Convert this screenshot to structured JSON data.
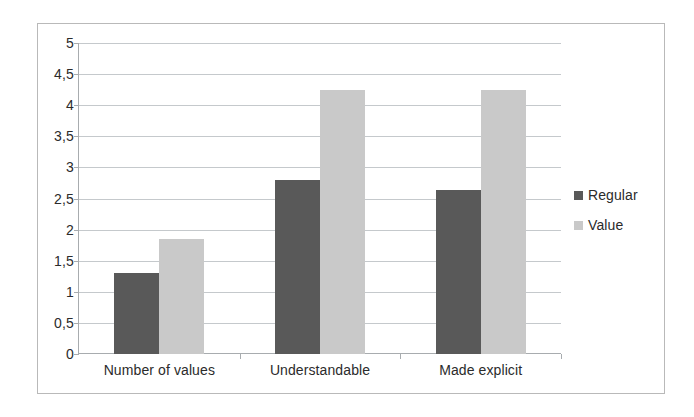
{
  "chart_data": {
    "type": "bar",
    "title": "",
    "xlabel": "",
    "ylabel": "",
    "ylim": [
      0,
      5
    ],
    "ytick_step": 0.5,
    "ytick_labels": [
      "0",
      "0,5",
      "1",
      "1,5",
      "2",
      "2,5",
      "3",
      "3,5",
      "4",
      "4,5",
      "5"
    ],
    "ytick_values": [
      0,
      0.5,
      1,
      1.5,
      2,
      2.5,
      3,
      3.5,
      4,
      4.5,
      5
    ],
    "grid": true,
    "legend_position": "right",
    "categories": [
      "Number of values",
      "Understandable",
      "Made explicit"
    ],
    "series": [
      {
        "name": "Regular",
        "color": "#595959",
        "values": [
          1.3,
          2.8,
          2.63
        ]
      },
      {
        "name": "Value",
        "color": "#c9c9c9",
        "values": [
          1.85,
          4.25,
          4.25
        ]
      }
    ]
  },
  "legend": {
    "items": [
      {
        "label": "Regular",
        "swatch": "legend-swatch-regular"
      },
      {
        "label": "Value",
        "swatch": "legend-swatch-value"
      }
    ]
  },
  "colors": {
    "series_regular": "#595959",
    "series_value": "#c9c9c9",
    "gridline": "#c5c9cc",
    "axis": "#a8acaf",
    "frame_border": "#b9b9b9",
    "text": "#2b2b2b",
    "background": "#ffffff"
  }
}
